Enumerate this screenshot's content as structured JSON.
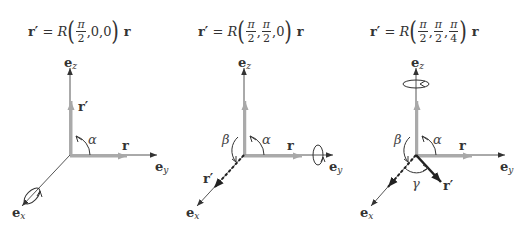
{
  "panels": [
    {
      "formula": {
        "lhs": "r′",
        "eq": "=",
        "op": "R",
        "args": [
          "π/2",
          "0",
          "0"
        ],
        "arg_text": [
          "π",
          "2",
          "0,0"
        ],
        "rhs": "r"
      },
      "labels": {
        "ez": "e",
        "ez_sub": "z",
        "ey": "e",
        "ey_sub": "y",
        "ex": "e",
        "ex_sub": "x",
        "r": "r",
        "rprime": "r′",
        "alpha": "α"
      },
      "rotation_axis": "x"
    },
    {
      "formula": {
        "lhs": "r′",
        "eq": "=",
        "op": "R",
        "args": [
          "π/2",
          "π/2",
          "0"
        ],
        "arg_text": [
          "π",
          "2",
          "π",
          "2",
          "0"
        ],
        "rhs": "r"
      },
      "labels": {
        "ez": "e",
        "ez_sub": "z",
        "ey": "e",
        "ey_sub": "y",
        "ex": "e",
        "ex_sub": "x",
        "r": "r",
        "rprime": "r′",
        "alpha": "α",
        "beta": "β"
      },
      "rotation_axis": "y"
    },
    {
      "formula": {
        "lhs": "r′",
        "eq": "=",
        "op": "R",
        "args": [
          "π/2",
          "π/2",
          "π/4"
        ],
        "arg_text": [
          "π",
          "2",
          "π",
          "2",
          "π",
          "4"
        ],
        "rhs": "r"
      },
      "labels": {
        "ez": "e",
        "ez_sub": "z",
        "ey": "e",
        "ey_sub": "y",
        "ex": "e",
        "ex_sub": "x",
        "r": "r",
        "rprime": "r′",
        "alpha": "α",
        "beta": "β",
        "gamma": "γ"
      },
      "rotation_axis": "z"
    }
  ],
  "comma": ","
}
